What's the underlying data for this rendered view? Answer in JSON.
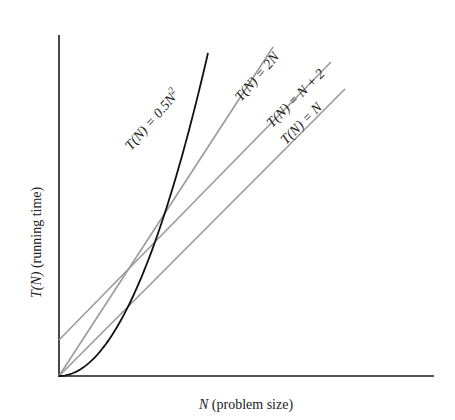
{
  "chart_data": {
    "type": "line",
    "title": "",
    "xlabel": "N (problem size)",
    "ylabel": "T(N) (running time)",
    "xlabel_parts": {
      "var": "N",
      "rest": " (problem size)"
    },
    "ylabel_parts": {
      "var": "T(N)",
      "rest": " (running time)"
    },
    "grid": false,
    "ticks": false,
    "legend": "inline labels",
    "series": [
      {
        "name": "T(N) = 0.5N^2",
        "label_main": "T(N) = 0.5N",
        "label_sup": "2",
        "kind": "quadratic",
        "formula": "0.5*N^2",
        "color": "#111111"
      },
      {
        "name": "T(N) = 2N",
        "label_main": "T(N) = 2N",
        "kind": "linear",
        "slope": 2,
        "intercept": 0,
        "color": "#9a9a9a"
      },
      {
        "name": "T(N) = N + 2",
        "label_main": "T(N) = N + 2",
        "kind": "linear",
        "slope": 1,
        "intercept": 2,
        "color": "#9a9a9a"
      },
      {
        "name": "T(N) = N",
        "label_main": "T(N) = N",
        "kind": "linear",
        "slope": 1,
        "intercept": 0,
        "color": "#9a9a9a"
      }
    ],
    "geometry_px": {
      "origin": [
        59,
        376
      ],
      "y_axis_top": [
        59,
        35
      ],
      "x_axis_end": [
        434,
        376
      ],
      "line_2N": [
        [
          59,
          376
        ],
        [
          273,
          47
        ]
      ],
      "line_N_plus_2": [
        [
          59,
          340
        ],
        [
          331,
          62
        ]
      ],
      "line_N": [
        [
          59,
          376
        ],
        [
          345,
          89
        ]
      ],
      "curve_half_N2": {
        "start": [
          59,
          376
        ],
        "end": [
          208,
          53
        ]
      }
    },
    "crossings_note": "0.5N^2 crosses N+2, 2N and N; N+2 crosses 2N at N=2"
  }
}
